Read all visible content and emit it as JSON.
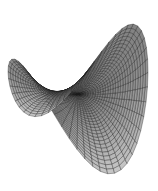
{
  "figure": {
    "type": "3d-surface-wireframe",
    "surface": "saddle (hyperbolic paraboloid)",
    "grid": {
      "u_lines": 28,
      "v_lines": 28
    },
    "colors": {
      "background": "#ffffff",
      "edge": "#1a1a1a",
      "face_dark": "#3c3c3c",
      "face_light": "#c8c8c8"
    },
    "outline": {
      "left_peak": [
        33,
        37
      ],
      "right_peak": [
        115,
        10
      ],
      "left_edge": [
        9,
        90
      ],
      "right_edge": [
        148,
        95
      ],
      "saddle_point": [
        70,
        92
      ],
      "left_lobe_bottom": [
        45,
        143
      ],
      "bottom_tip": [
        108,
        180
      ]
    }
  }
}
